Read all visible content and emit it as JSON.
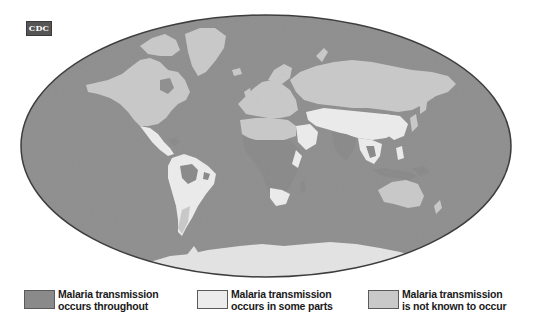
{
  "logo": {
    "text": "CDC"
  },
  "map": {
    "projection": "ellipse-world",
    "colors": {
      "ocean": "#8f8f8f",
      "throughout": "#8a8a8a",
      "some_parts": "#ececec",
      "not_known": "#c9c9c9",
      "outline": "#3d3d3d"
    }
  },
  "legend": {
    "items": [
      {
        "line1": "Malaria transmission",
        "line2": "occurs throughout",
        "color": "#8a8a8a"
      },
      {
        "line1": "Malaria transmission",
        "line2": "occurs in some parts",
        "color": "#ececec"
      },
      {
        "line1": "Malaria transmission",
        "line2": "is not known to occur",
        "color": "#c9c9c9"
      }
    ]
  }
}
